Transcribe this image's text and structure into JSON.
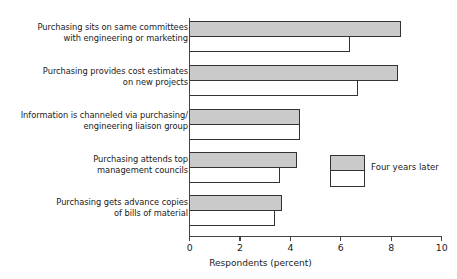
{
  "chart_data": {
    "type": "bar",
    "orientation": "horizontal",
    "title": "",
    "xlabel": "Respondents (percent)",
    "ylabel": "",
    "xlim": [
      0,
      10
    ],
    "xticks": [
      "0",
      "2",
      "4",
      "6",
      "8",
      "10"
    ],
    "grid": false,
    "legend": {
      "position": "inside-right",
      "entries": [
        {
          "name": "Four years later",
          "swatch": "gray-over-white"
        }
      ]
    },
    "categories": [
      "Purchasing sits on same committees\nwith engineering or marketing",
      "Purchasing provides cost estimates\non new projects",
      "Information is channeled via purchasing/\nengineering liaison group",
      "Purchasing attends top\nmanagement councils",
      "Purchasing gets advance copies\nof bills of material"
    ],
    "series": [
      {
        "name": "Four years later",
        "style": "gray-filled",
        "color": "#cacaca",
        "values": [
          8.4,
          8.3,
          4.4,
          4.3,
          3.7
        ]
      },
      {
        "name": "Initial",
        "style": "white-unfilled",
        "color": "#ffffff",
        "values": [
          6.4,
          6.7,
          4.4,
          3.6,
          3.4
        ]
      }
    ]
  },
  "legend_label": "Four years later",
  "axis_title": "Respondents (percent)"
}
